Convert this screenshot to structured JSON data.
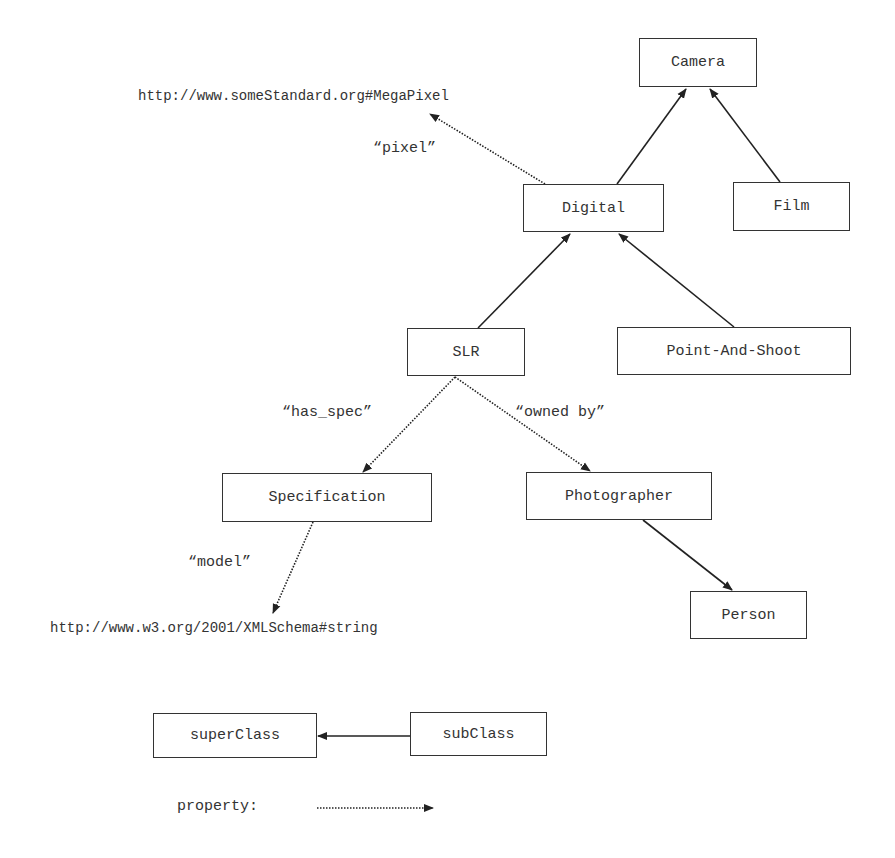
{
  "nodes": {
    "camera": "Camera",
    "digital": "Digital",
    "film": "Film",
    "slr": "SLR",
    "point_and_shoot": "Point-And-Shoot",
    "specification": "Specification",
    "photographer": "Photographer",
    "person": "Person"
  },
  "literals": {
    "megapixel_uri": "http://www.someStandard.org#MegaPixel",
    "xmlschema_string_uri": "http://www.w3.org/2001/XMLSchema#string"
  },
  "properties": {
    "pixel": "“pixel”",
    "has_spec": "“has_spec”",
    "owned_by": "“owned by”",
    "model": "“model”"
  },
  "edges": [
    {
      "from": "Digital",
      "to": "Camera",
      "type": "subclass"
    },
    {
      "from": "Film",
      "to": "Camera",
      "type": "subclass"
    },
    {
      "from": "SLR",
      "to": "Digital",
      "type": "subclass"
    },
    {
      "from": "Point-And-Shoot",
      "to": "Digital",
      "type": "subclass"
    },
    {
      "from": "Photographer",
      "to": "Person",
      "type": "subclass"
    },
    {
      "from": "Digital",
      "to": "http://www.someStandard.org#MegaPixel",
      "type": "property",
      "label": "pixel"
    },
    {
      "from": "SLR",
      "to": "Specification",
      "type": "property",
      "label": "has_spec"
    },
    {
      "from": "SLR",
      "to": "Photographer",
      "type": "property",
      "label": "owned by"
    },
    {
      "from": "Specification",
      "to": "http://www.w3.org/2001/XMLSchema#string",
      "type": "property",
      "label": "model"
    }
  ],
  "legend": {
    "superclass": "superClass",
    "subclass": "subClass",
    "property_label": "property:"
  },
  "colors": {
    "line": "#222222",
    "text": "#333333",
    "background": "#ffffff"
  }
}
